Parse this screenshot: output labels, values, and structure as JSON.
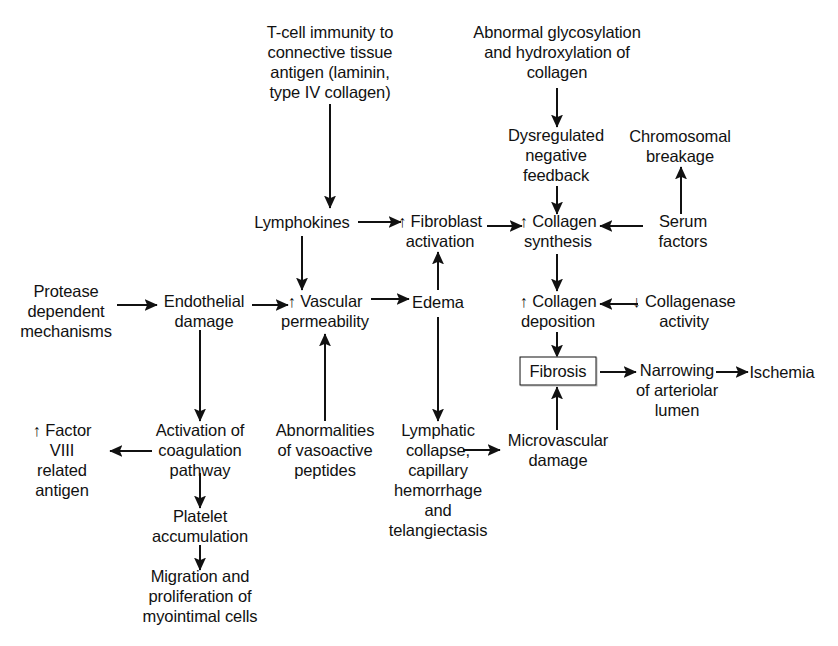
{
  "diagram": {
    "background_color": "#ffffff",
    "line_color": "#111111",
    "text_color": "#111111",
    "nodes": [
      {
        "id": "tcell",
        "label": "T-cell immunity to\nconnective tissue\nantigen (laminin,\ntype IV collagen)",
        "x": 330,
        "y": 62,
        "boxed": false
      },
      {
        "id": "abnormal",
        "label": "Abnormal glycosylation\nand hydroxylation of\ncollagen",
        "x": 557,
        "y": 52,
        "boxed": false
      },
      {
        "id": "dysregulated",
        "label": "Dysregulated\nnegative\nfeedback",
        "x": 556,
        "y": 155,
        "boxed": false
      },
      {
        "id": "chromosomal",
        "label": "Chromosomal\nbreakage",
        "x": 680,
        "y": 146,
        "boxed": false
      },
      {
        "id": "lymphokines",
        "label": "Lymphokines",
        "x": 302,
        "y": 222,
        "boxed": false
      },
      {
        "id": "fibroblast",
        "label": "↑ Fibroblast\nactivation",
        "x": 440,
        "y": 231,
        "boxed": false
      },
      {
        "id": "collsynth",
        "label": "↑ Collagen\nsynthesis",
        "x": 558,
        "y": 231,
        "boxed": false
      },
      {
        "id": "serum",
        "label": "Serum\nfactors",
        "x": 683,
        "y": 231,
        "boxed": false
      },
      {
        "id": "protease",
        "label": "Protease\ndependent\nmechanisms",
        "x": 66,
        "y": 311,
        "boxed": false
      },
      {
        "id": "endothelial",
        "label": "Endothelial\ndamage",
        "x": 204,
        "y": 311,
        "boxed": false
      },
      {
        "id": "vascular",
        "label": "↑ Vascular\npermeability",
        "x": 325,
        "y": 311,
        "boxed": false
      },
      {
        "id": "edema",
        "label": "Edema",
        "x": 438,
        "y": 302,
        "boxed": false
      },
      {
        "id": "colldep",
        "label": "↑ Collagen\ndeposition",
        "x": 558,
        "y": 311,
        "boxed": false
      },
      {
        "id": "collagenase",
        "label": "↓ Collagenase\nactivity",
        "x": 684,
        "y": 311,
        "boxed": false
      },
      {
        "id": "fibrosis",
        "label": "Fibrosis",
        "x": 558,
        "y": 371,
        "boxed": true
      },
      {
        "id": "narrowing",
        "label": "Narrowing\nof arteriolar\nlumen",
        "x": 677,
        "y": 390,
        "boxed": false
      },
      {
        "id": "ischemia",
        "label": "Ischemia",
        "x": 782,
        "y": 372,
        "boxed": false
      },
      {
        "id": "factor8",
        "label": "↑ Factor\nVIII\nrelated\nantigen",
        "x": 62,
        "y": 460,
        "boxed": false
      },
      {
        "id": "activation",
        "label": "Activation of\ncoagulation\npathway",
        "x": 200,
        "y": 450,
        "boxed": false
      },
      {
        "id": "vasoactive",
        "label": "Abnormalities\nof vasoactive\npeptides",
        "x": 325,
        "y": 450,
        "boxed": false
      },
      {
        "id": "lymphatic",
        "label": "Lymphatic\ncollapse,\ncapillary\nhemorrhage\nand\ntelangiectasis",
        "x": 438,
        "y": 480,
        "boxed": false
      },
      {
        "id": "microvasc",
        "label": "Microvascular\ndamage",
        "x": 558,
        "y": 450,
        "boxed": false
      },
      {
        "id": "platelet",
        "label": "Platelet\naccumulation",
        "x": 200,
        "y": 526,
        "boxed": false
      },
      {
        "id": "migration",
        "label": "Migration and\nproliferation of\nmyointimal cells",
        "x": 200,
        "y": 596,
        "boxed": false
      }
    ],
    "edges": [
      {
        "id": "tcell-to-lymphokines",
        "from": "tcell",
        "to": "lymphokines",
        "x1": 330,
        "y1": 104,
        "x2": 330,
        "y2": 208
      },
      {
        "id": "abnormal-to-dysregulated",
        "from": "abnormal",
        "to": "dysregulated",
        "x1": 557,
        "y1": 88,
        "x2": 557,
        "y2": 127
      },
      {
        "id": "dysregulated-to-collsynth",
        "from": "dysregulated",
        "to": "collsynth",
        "x1": 557,
        "y1": 186,
        "x2": 557,
        "y2": 214
      },
      {
        "id": "serum-to-chromosomal",
        "from": "serum",
        "to": "chromosomal",
        "x1": 681,
        "y1": 214,
        "x2": 681,
        "y2": 167
      },
      {
        "id": "lymphokines-to-fibroblast",
        "from": "lymphokines",
        "to": "fibroblast",
        "x1": 358,
        "y1": 222,
        "x2": 401,
        "y2": 222
      },
      {
        "id": "fibroblast-to-collsynth",
        "from": "fibroblast",
        "to": "collsynth",
        "x1": 487,
        "y1": 226,
        "x2": 522,
        "y2": 226
      },
      {
        "id": "serum-to-collsynth",
        "from": "serum",
        "to": "collsynth",
        "x1": 643,
        "y1": 226,
        "x2": 600,
        "y2": 226
      },
      {
        "id": "lymphokines-to-vascular",
        "from": "lymphokines",
        "to": "vascular",
        "x1": 302,
        "y1": 236,
        "x2": 302,
        "y2": 290
      },
      {
        "id": "collsynth-to-colldep",
        "from": "collsynth",
        "to": "colldep",
        "x1": 557,
        "y1": 254,
        "x2": 557,
        "y2": 291
      },
      {
        "id": "collagenase-to-colldep",
        "from": "collagenase",
        "to": "colldep",
        "x1": 638,
        "y1": 304,
        "x2": 600,
        "y2": 304
      },
      {
        "id": "protease-to-endothelial",
        "from": "protease",
        "to": "endothelial",
        "x1": 117,
        "y1": 305,
        "x2": 157,
        "y2": 305
      },
      {
        "id": "endothelial-to-vascular",
        "from": "endothelial",
        "to": "vascular",
        "x1": 252,
        "y1": 305,
        "x2": 288,
        "y2": 305
      },
      {
        "id": "vascular-to-edema",
        "from": "vascular",
        "to": "edema",
        "x1": 371,
        "y1": 299,
        "x2": 409,
        "y2": 299
      },
      {
        "id": "edema-to-fibroblast",
        "from": "edema",
        "to": "fibroblast",
        "x1": 438,
        "y1": 290,
        "x2": 438,
        "y2": 252
      },
      {
        "id": "endothelial-to-activation",
        "from": "endothelial",
        "to": "activation",
        "x1": 200,
        "y1": 330,
        "x2": 200,
        "y2": 421
      },
      {
        "id": "vasoactive-to-vascular",
        "from": "vasoactive",
        "to": "vascular",
        "x1": 325,
        "y1": 421,
        "x2": 325,
        "y2": 334
      },
      {
        "id": "edema-to-lymphatic",
        "from": "edema",
        "to": "lymphatic",
        "x1": 438,
        "y1": 317,
        "x2": 438,
        "y2": 421
      },
      {
        "id": "colldep-to-fibrosis",
        "from": "colldep",
        "to": "fibrosis",
        "x1": 557,
        "y1": 332,
        "x2": 557,
        "y2": 357
      },
      {
        "id": "microvasc-to-fibrosis",
        "from": "microvasc",
        "to": "fibrosis",
        "x1": 557,
        "y1": 430,
        "x2": 557,
        "y2": 387
      },
      {
        "id": "fibrosis-to-narrowing",
        "from": "fibrosis",
        "to": "narrowing",
        "x1": 600,
        "y1": 372,
        "x2": 636,
        "y2": 372
      },
      {
        "id": "narrowing-to-ischemia",
        "from": "narrowing",
        "to": "ischemia",
        "x1": 716,
        "y1": 372,
        "x2": 748,
        "y2": 372
      },
      {
        "id": "activation-to-factor8",
        "from": "activation",
        "to": "factor8",
        "x1": 152,
        "y1": 451,
        "x2": 110,
        "y2": 451
      },
      {
        "id": "activation-to-platelet",
        "from": "activation",
        "to": "platelet",
        "x1": 200,
        "y1": 473,
        "x2": 200,
        "y2": 508
      },
      {
        "id": "platelet-to-migration",
        "from": "platelet",
        "to": "migration",
        "x1": 200,
        "y1": 545,
        "x2": 200,
        "y2": 570
      },
      {
        "id": "lymphatic-to-microvasc",
        "from": "lymphatic",
        "to": "microvasc",
        "x1": 463,
        "y1": 450,
        "x2": 500,
        "y2": 450
      }
    ]
  }
}
